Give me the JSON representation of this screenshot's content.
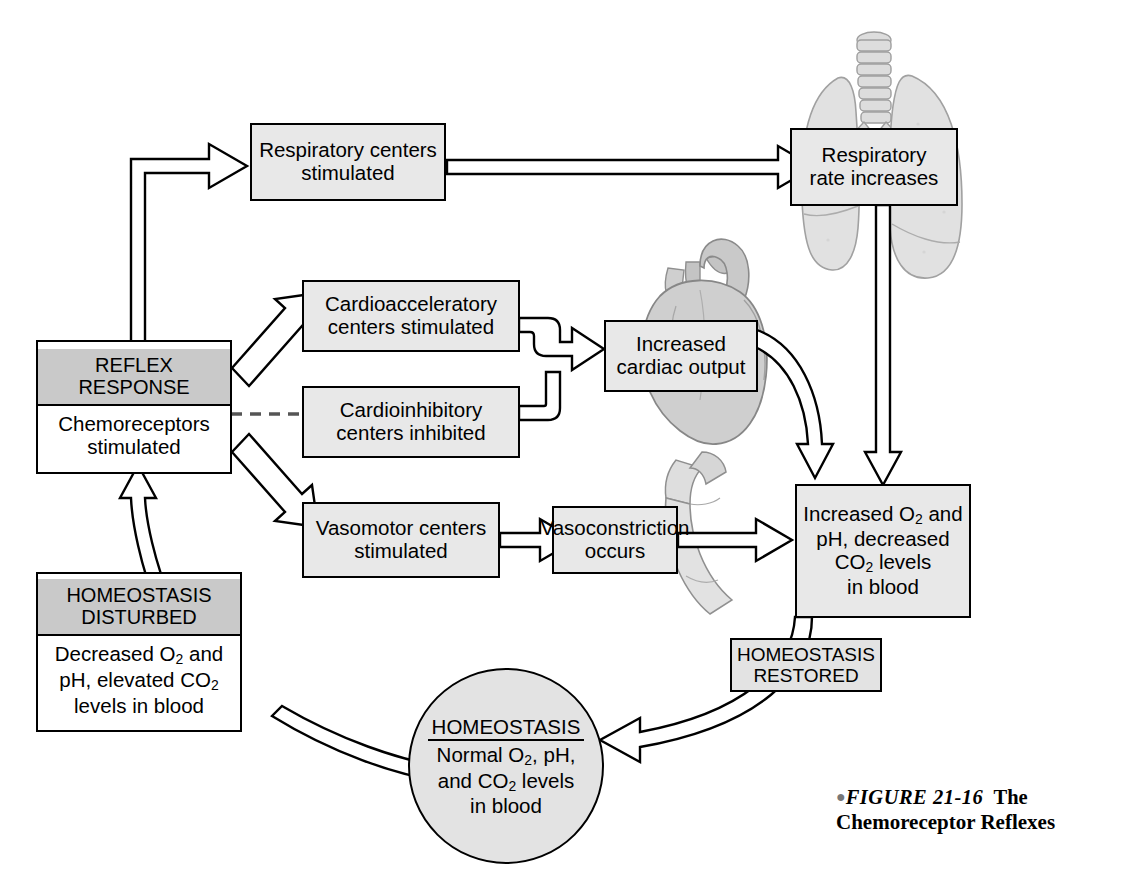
{
  "figure": {
    "bullet": "●",
    "label": "FIGURE 21-16",
    "title_part1": "The",
    "title_part2": "Chemoreceptor Reflexes"
  },
  "colors": {
    "box_fill": "#e3e3e3",
    "header_fill": "#c9c9c9",
    "body_fill": "#ffffff",
    "outline": "#000000",
    "illustration": "#d8d8d8"
  },
  "nodes": {
    "respiratory_centers": {
      "text": "Respiratory centers stimulated",
      "line1": "Respiratory centers",
      "line2": "stimulated"
    },
    "respiratory_rate": {
      "line1": "Respiratory",
      "line2": "rate increases"
    },
    "cardioaccelerator": {
      "line1": "Cardioacceleratory",
      "line2": "centers stimulated"
    },
    "cardioinhibitory": {
      "line1": "Cardioinhibitory",
      "line2": "centers inhibited"
    },
    "cardiac_output": {
      "line1": "Increased",
      "line2": "cardiac output"
    },
    "vasomotor": {
      "line1": "Vasomotor centers",
      "line2": "stimulated"
    },
    "vasoconstriction": {
      "line1": "Vasoconstriction",
      "line2": "occurs"
    },
    "reflex_response": {
      "header_line1": "REFLEX",
      "header_line2": "RESPONSE",
      "body_line1": "Chemoreceptors",
      "body_line2": "stimulated"
    },
    "homeostasis_disturbed": {
      "header_line1": "HOMEOSTASIS",
      "header_line2": "DISTURBED",
      "body_line1_a": "Decreased O",
      "body_line1_sub": "2",
      "body_line1_b": " and",
      "body_line2_a": "pH, elevated CO",
      "body_line2_sub": "2",
      "body_line3": "levels in blood"
    },
    "increased_levels": {
      "line1_a": "Increased O",
      "line1_sub": "2",
      "line1_b": " and",
      "line2": "pH, decreased",
      "line3_a": "CO",
      "line3_sub": "2",
      "line3_b": " levels",
      "line4": "in blood"
    },
    "homeostasis_restored": {
      "line1": "HOMEOSTASIS",
      "line2": "RESTORED"
    },
    "homeostasis_circle": {
      "title": "HOMEOSTASIS",
      "line1_a": "Normal O",
      "line1_sub": "2",
      "line1_b": ", pH,",
      "line2_a": "and CO",
      "line2_sub": "2",
      "line2_b": " levels",
      "line3": "in blood"
    }
  },
  "illustrations": {
    "lungs": "lungs-trachea-illustration",
    "heart": "heart-illustration",
    "vessel": "blood-vessel-illustration"
  },
  "connectors": [
    {
      "from": "reflex_response",
      "to": "respiratory_centers",
      "style": "hollow-arrow"
    },
    {
      "from": "respiratory_centers",
      "to": "respiratory_rate",
      "style": "hollow-arrow"
    },
    {
      "from": "respiratory_rate",
      "to": "increased_levels",
      "style": "hollow-arrow"
    },
    {
      "from": "reflex_response",
      "to": "cardioaccelerator",
      "style": "hollow-arrow"
    },
    {
      "from": "reflex_response",
      "to": "cardioinhibitory",
      "style": "dashed-inhibition"
    },
    {
      "from": "cardioaccelerator",
      "to": "cardiac_output",
      "style": "hollow-arrow"
    },
    {
      "from": "cardioinhibitory",
      "to": "cardiac_output",
      "style": "hollow-arrow"
    },
    {
      "from": "cardiac_output",
      "to": "increased_levels",
      "style": "hollow-curved-arrow"
    },
    {
      "from": "reflex_response",
      "to": "vasomotor",
      "style": "hollow-arrow"
    },
    {
      "from": "vasomotor",
      "to": "vasoconstriction",
      "style": "hollow-arrow"
    },
    {
      "from": "vasoconstriction",
      "to": "increased_levels",
      "style": "hollow-arrow"
    },
    {
      "from": "increased_levels",
      "to": "homeostasis_circle",
      "style": "hollow-curved-arrow"
    },
    {
      "from": "homeostasis_disturbed",
      "to": "homeostasis_circle",
      "style": "hollow-curved-band"
    },
    {
      "from": "homeostasis_disturbed",
      "to": "reflex_response",
      "style": "hollow-arrow"
    }
  ]
}
